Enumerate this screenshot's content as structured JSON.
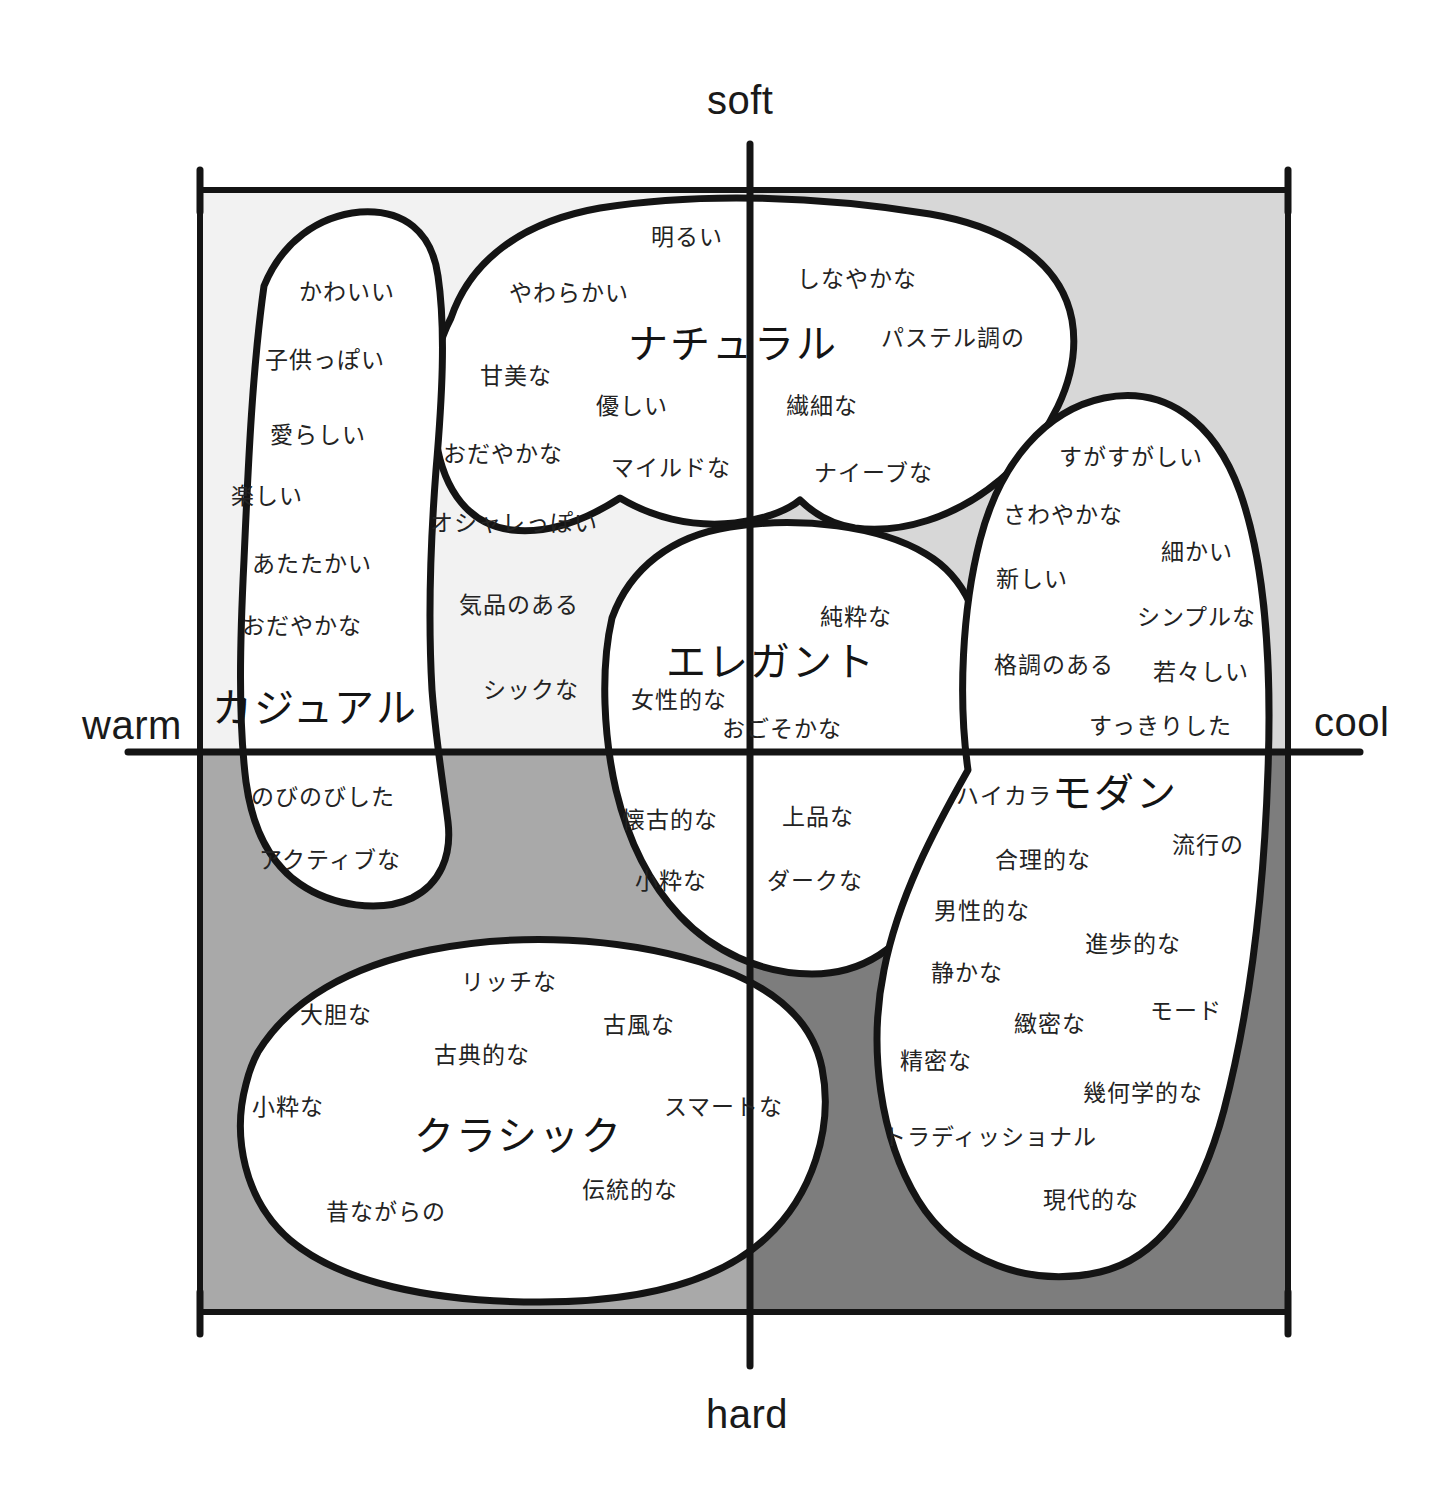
{
  "axes": {
    "top": {
      "label": "soft",
      "x": 750,
      "y": 98
    },
    "bottom": {
      "label": "hard",
      "x": 750,
      "y": 1412
    },
    "left": {
      "label": "warm",
      "x": 130,
      "y": 725
    },
    "right": {
      "label": "cool",
      "x": 1358,
      "y": 722
    }
  },
  "colors": {
    "ink": "#141414",
    "text": "#232323",
    "background": "#ffffff",
    "fill_white": "#ffffff",
    "fill_soft_warm": "#f2f2f2",
    "fill_soft_cool": "#d7d7d7",
    "fill_hard_warm": "#a9a9a9",
    "fill_hard_cool": "#7d7d7d",
    "fill_casual_gap": "#ededed"
  },
  "frame": {
    "left": 200,
    "right": 1288,
    "top": 190,
    "bottom": 1312,
    "origin_x": 750,
    "origin_y": 752
  },
  "regions": [
    {
      "id": "casual",
      "name": "カジュアル",
      "name_pos": {
        "x": 315,
        "y": 705
      },
      "terms": [
        {
          "text": "かわいい",
          "x": 347,
          "y": 290
        },
        {
          "text": "子供っぽい",
          "x": 325,
          "y": 358
        },
        {
          "text": "愛らしい",
          "x": 318,
          "y": 433
        },
        {
          "text": "楽しい",
          "x": 267,
          "y": 494
        },
        {
          "text": "あたたかい",
          "x": 312,
          "y": 562
        },
        {
          "text": "おだやかな",
          "x": 302,
          "y": 624
        },
        {
          "text": "のびのびした",
          "x": 323,
          "y": 795
        },
        {
          "text": "アクティブな",
          "x": 330,
          "y": 858
        }
      ]
    },
    {
      "id": "natural",
      "name": "ナチュラル",
      "name_pos": {
        "x": 733,
        "y": 341
      },
      "terms": [
        {
          "text": "明るい",
          "x": 687,
          "y": 235
        },
        {
          "text": "やわらかい",
          "x": 569,
          "y": 291
        },
        {
          "text": "しなやかな",
          "x": 857,
          "y": 277
        },
        {
          "text": "パステル調の",
          "x": 953,
          "y": 336
        },
        {
          "text": "甘美な",
          "x": 516,
          "y": 374
        },
        {
          "text": "優しい",
          "x": 632,
          "y": 404
        },
        {
          "text": "繊細な",
          "x": 822,
          "y": 404
        },
        {
          "text": "おだやかな",
          "x": 503,
          "y": 452
        },
        {
          "text": "マイルドな",
          "x": 671,
          "y": 466
        },
        {
          "text": "ナイーブな",
          "x": 873,
          "y": 471
        },
        {
          "text": "オシャレっぽい",
          "x": 514,
          "y": 521
        },
        {
          "text": "気品のある",
          "x": 519,
          "y": 603
        },
        {
          "text": "シックな",
          "x": 531,
          "y": 688
        }
      ]
    },
    {
      "id": "elegant",
      "name": "エレガント",
      "name_pos": {
        "x": 771,
        "y": 659
      },
      "terms": [
        {
          "text": "純粋な",
          "x": 856,
          "y": 615
        },
        {
          "text": "女性的な",
          "x": 679,
          "y": 698
        },
        {
          "text": "おごそかな",
          "x": 782,
          "y": 727
        },
        {
          "text": "懐古的な",
          "x": 670,
          "y": 818
        },
        {
          "text": "上品な",
          "x": 818,
          "y": 815
        },
        {
          "text": "小粋な",
          "x": 671,
          "y": 879
        },
        {
          "text": "ダークな",
          "x": 815,
          "y": 879
        }
      ]
    },
    {
      "id": "modern",
      "name": "モダン",
      "name_pos": {
        "x": 1115,
        "y": 790
      },
      "terms": [
        {
          "text": "すがすがしい",
          "x": 1131,
          "y": 455
        },
        {
          "text": "さわやかな",
          "x": 1063,
          "y": 513
        },
        {
          "text": "細かい",
          "x": 1197,
          "y": 550
        },
        {
          "text": "新しい",
          "x": 1032,
          "y": 577
        },
        {
          "text": "シンプルな",
          "x": 1196,
          "y": 615
        },
        {
          "text": "格調のある",
          "x": 1054,
          "y": 663
        },
        {
          "text": "若々しい",
          "x": 1201,
          "y": 670
        },
        {
          "text": "すっきりした",
          "x": 1160,
          "y": 724
        },
        {
          "text": "ハイカラ",
          "x": 1004,
          "y": 794
        },
        {
          "text": "流行の",
          "x": 1208,
          "y": 843
        },
        {
          "text": "合理的な",
          "x": 1043,
          "y": 858
        },
        {
          "text": "男性的な",
          "x": 982,
          "y": 909
        },
        {
          "text": "進歩的な",
          "x": 1133,
          "y": 942
        },
        {
          "text": "静かな",
          "x": 967,
          "y": 971
        },
        {
          "text": "モード",
          "x": 1186,
          "y": 1009
        },
        {
          "text": "緻密な",
          "x": 1050,
          "y": 1022
        },
        {
          "text": "精密な",
          "x": 936,
          "y": 1059
        },
        {
          "text": "幾何学的な",
          "x": 1143,
          "y": 1091
        },
        {
          "text": "トラディッショナル",
          "x": 990,
          "y": 1135
        },
        {
          "text": "現代的な",
          "x": 1091,
          "y": 1198
        }
      ]
    },
    {
      "id": "classic",
      "name": "クラシック",
      "name_pos": {
        "x": 518,
        "y": 1133
      },
      "terms": [
        {
          "text": "リッチな",
          "x": 509,
          "y": 980
        },
        {
          "text": "大胆な",
          "x": 336,
          "y": 1013
        },
        {
          "text": "古風な",
          "x": 639,
          "y": 1023
        },
        {
          "text": "古典的な",
          "x": 482,
          "y": 1053
        },
        {
          "text": "小粋な",
          "x": 288,
          "y": 1105
        },
        {
          "text": "スマートな",
          "x": 723,
          "y": 1105
        },
        {
          "text": "伝統的な",
          "x": 630,
          "y": 1188
        },
        {
          "text": "昔ながらの",
          "x": 386,
          "y": 1210
        }
      ]
    }
  ]
}
